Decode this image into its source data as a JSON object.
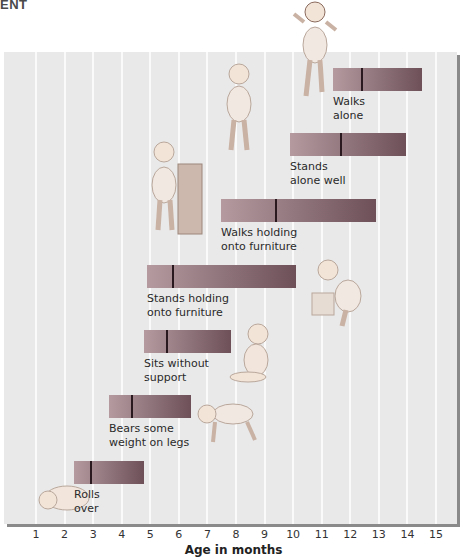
{
  "heading": "ENT",
  "chart_data": {
    "type": "bar",
    "subtype": "floating-range (milestone age ranges with median marker)",
    "title": "",
    "xlabel": "Age in months",
    "ylabel": "",
    "xlim": [
      1,
      15
    ],
    "x_ticks": [
      "1",
      "2",
      "3",
      "4",
      "5",
      "6",
      "7",
      "8",
      "9",
      "10",
      "11",
      "12",
      "13",
      "14",
      "15"
    ],
    "grid": "vertical lines at each month",
    "legend": null,
    "categories": [
      "Rolls over",
      "Bears some weight on legs",
      "Sits without support",
      "Stands holding onto furniture",
      "Walks holding onto furniture",
      "Stands alone well",
      "Walks alone"
    ],
    "series": [
      {
        "name": "range_start",
        "values": [
          2.3,
          3.6,
          4.8,
          4.9,
          7.5,
          9.9,
          11.4
        ]
      },
      {
        "name": "median",
        "values": [
          2.9,
          4.3,
          5.5,
          5.8,
          9.3,
          11.6,
          12.3
        ]
      },
      {
        "name": "range_end",
        "values": [
          4.8,
          6.4,
          7.8,
          10.1,
          12.9,
          13.9,
          14.5
        ]
      }
    ]
  },
  "bars": [
    {
      "label": "Rolls\nover",
      "x": 74,
      "w": 70,
      "y": 461,
      "median_x": 16
    },
    {
      "label": "Bears some\nweight on legs",
      "x": 109,
      "w": 82,
      "y": 395,
      "median_x": 22
    },
    {
      "label": "Sits without\nsupport",
      "x": 144,
      "w": 87,
      "y": 330,
      "median_x": 22
    },
    {
      "label": "Stands holding\nonto furniture",
      "x": 147,
      "w": 149,
      "y": 265,
      "median_x": 25
    },
    {
      "label": "Walks holding\nonto furniture",
      "x": 221,
      "w": 155,
      "y": 199,
      "median_x": 54
    },
    {
      "label": "Stands\nalone well",
      "x": 290,
      "w": 116,
      "y": 133,
      "median_x": 50
    },
    {
      "label": "Walks\nalone",
      "x": 333,
      "w": 89,
      "y": 68,
      "median_x": 28
    }
  ],
  "colors": {
    "panel": "#e9e9e9",
    "bar_start": "#b59aa0",
    "bar_end": "#6d5058",
    "median": "#2a1a1f"
  }
}
